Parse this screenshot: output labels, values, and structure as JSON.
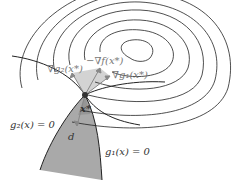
{
  "diagram": {
    "labels": {
      "grad_g2": "∇g₂(x*)",
      "neg_grad_f": "−∇f(x*)",
      "grad_g1": "∇g₁(x*)",
      "point": "x*",
      "direction": "d",
      "constraint_g2": "g₂(x) = 0",
      "constraint_g1": "g₁(x) = 0"
    },
    "colors": {
      "contour": "#222222",
      "feasible_region": "#a9a9a9",
      "cone": "#c8c8c8",
      "arrow": "#888888",
      "point": "#333333"
    }
  }
}
